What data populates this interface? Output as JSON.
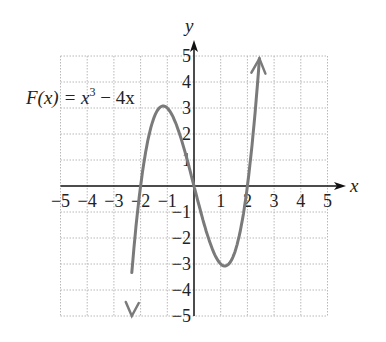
{
  "chart_data": {
    "type": "line",
    "title": "",
    "function_label": "F(x) = x³ − 4x",
    "function_label_parts": {
      "lhs": "F(x) = x",
      "exp": "3",
      "rhs": " − 4x"
    },
    "xlabel": "x",
    "ylabel": "y",
    "xlim": [
      -5,
      5
    ],
    "ylim": [
      -5,
      5
    ],
    "grid": true,
    "x_ticks": [
      "−5",
      "−4",
      "−3",
      "−2",
      "−1",
      "1",
      "2",
      "3",
      "4",
      "5"
    ],
    "y_ticks": [
      "5",
      "4",
      "3",
      "2",
      "1",
      "−1",
      "−2",
      "−3",
      "−4",
      "−5"
    ],
    "series": [
      {
        "name": "F(x) = x^3 - 4x",
        "color": "#7a7a7a",
        "x": [
          -2.33,
          -2.0,
          -1.5,
          -1.155,
          -0.5,
          0.0,
          0.5,
          1.155,
          1.5,
          2.0,
          2.45
        ],
        "y": [
          -5.0,
          0.0,
          2.63,
          3.08,
          1.88,
          0.0,
          -1.88,
          -3.08,
          -2.63,
          0.0,
          4.9
        ]
      }
    ],
    "key_points": {
      "zeros": [
        -2,
        0,
        2
      ],
      "local_max": [
        -1.155,
        3.08
      ],
      "local_min": [
        1.155,
        -3.08
      ]
    }
  },
  "colors": {
    "curve": "#7a7a7a",
    "axis": "#111111",
    "grid": "#b8b8b8"
  }
}
